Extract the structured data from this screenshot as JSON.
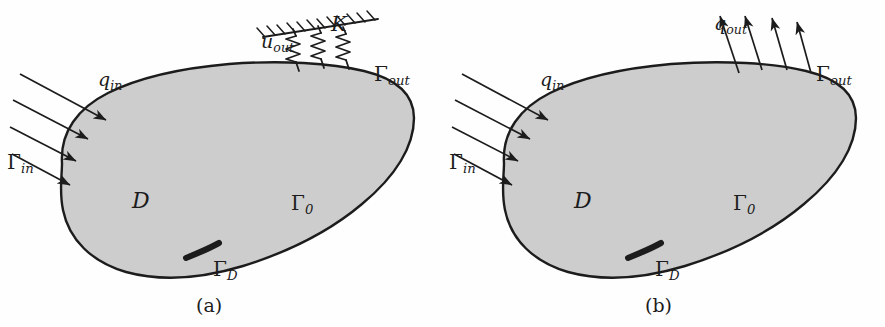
{
  "figure": {
    "background_color": "#fefefe",
    "ink_color": "#1c1c1c",
    "domain_fill_color": "#cdcdcd",
    "width": 885,
    "height": 327
  },
  "panels": [
    {
      "id": "a",
      "caption": "(a)",
      "caption_x": 196,
      "caption_y": 296,
      "labels": {
        "domain": "D",
        "gamma_in_base": "Γ",
        "gamma_in_sub": "in",
        "gamma_out_base": "Γ",
        "gamma_out_sub": "out",
        "gamma_0_base": "Γ",
        "gamma_0_sub": "0",
        "gamma_D_base": "Γ",
        "gamma_D_sub": "D",
        "q_in_base": "q",
        "q_in_sub": "in",
        "u_out_base": "u",
        "u_out_sub": "out",
        "spring_stiffness": "K"
      },
      "boundary_condition_out": "elastic-spring-support",
      "spring_count": 3,
      "inflow_arrow_count": 4
    },
    {
      "id": "b",
      "caption": "(b)",
      "caption_x": 645,
      "caption_y": 296,
      "labels": {
        "domain": "D",
        "gamma_in_base": "Γ",
        "gamma_in_sub": "in",
        "gamma_out_base": "Γ",
        "gamma_out_sub": "out",
        "gamma_0_base": "Γ",
        "gamma_0_sub": "0",
        "gamma_D_base": "Γ",
        "gamma_D_sub": "D",
        "q_in_base": "q",
        "q_in_sub": "in",
        "q_out_base": "q",
        "q_out_sub": "out"
      },
      "boundary_condition_out": "outflow-flux-arrows",
      "outflow_arrow_count": 4,
      "inflow_arrow_count": 4
    }
  ],
  "geometry": {
    "blob_path": "M 62,163 C 60,132 78,108 108,93 C 140,77 183,68 229,64 C 281,60 331,63 364,71 C 397,79 414,95 414,118 C 414,146 396,176 362,204 C 330,231 288,252 243,266 C 200,279 159,281 126,272 C 92,262 69,240 63,210 C 59,191 62,176 62,163 Z",
    "gamma_d_path": "M 186,258 C 196,254 208,249 219,243",
    "inflow_arrows": [
      {
        "x1": 20,
        "y1": 74,
        "x2": 106,
        "y2": 120
      },
      {
        "x1": 13,
        "y1": 100,
        "x2": 88,
        "y2": 139
      },
      {
        "x1": 10,
        "y1": 127,
        "x2": 76,
        "y2": 161
      },
      {
        "x1": 12,
        "y1": 154,
        "x2": 70,
        "y2": 185
      }
    ],
    "outflow_arrows": [
      {
        "x1": 297,
        "y1": 73,
        "x2": 278,
        "y2": 16
      },
      {
        "x1": 320,
        "y1": 70,
        "x2": 303,
        "y2": 16
      },
      {
        "x1": 345,
        "y1": 70,
        "x2": 330,
        "y2": 18
      },
      {
        "x1": 369,
        "y1": 73,
        "x2": 355,
        "y2": 22
      }
    ],
    "springs": [
      {
        "bx": 299,
        "by": 71,
        "tx": 283,
        "ty": 30
      },
      {
        "bx": 324,
        "by": 68,
        "tx": 308,
        "ty": 27
      },
      {
        "bx": 349,
        "by": 69,
        "tx": 333,
        "ty": 28
      }
    ],
    "ground_line": {
      "x1": 263,
      "y1": 37,
      "x2": 378,
      "y2": 19
    }
  },
  "label_positions": {
    "panel_a": {
      "gamma_in": {
        "x": 7,
        "y": 160
      },
      "q_in": {
        "x": 98,
        "y": 82
      },
      "u_out": {
        "x": 261,
        "y": 42
      },
      "K": {
        "x": 331,
        "y": 25
      },
      "gamma_out": {
        "x": 374,
        "y": 73
      },
      "gamma_0": {
        "x": 291,
        "y": 201
      },
      "gamma_D": {
        "x": 213,
        "y": 268
      },
      "domain": {
        "x": 132,
        "y": 202
      }
    },
    "panel_b": {
      "gamma_in": {
        "x": 7,
        "y": 160
      },
      "q_in": {
        "x": 98,
        "y": 82
      },
      "q_out": {
        "x": 272,
        "y": 24
      },
      "gamma_out": {
        "x": 374,
        "y": 73
      },
      "gamma_0": {
        "x": 291,
        "y": 201
      },
      "gamma_D": {
        "x": 213,
        "y": 268
      },
      "domain": {
        "x": 132,
        "y": 202
      }
    }
  }
}
